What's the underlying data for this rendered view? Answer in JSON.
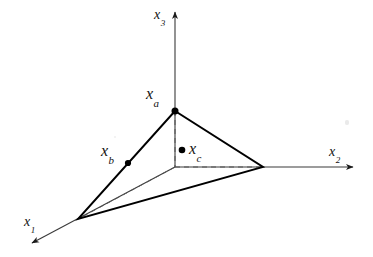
{
  "figure": {
    "type": "geometric-diagram",
    "background_color": "#ffffff",
    "line_color": "#000000",
    "width": 373,
    "height": 257
  },
  "axes": [
    {
      "id": "x1",
      "base": "x",
      "subscript": "1",
      "label": "x₁",
      "direction": "down-left",
      "origin": [
        175,
        167
      ],
      "tip": [
        27,
        246
      ],
      "label_position": [
        24,
        213
      ]
    },
    {
      "id": "x2",
      "base": "x",
      "subscript": "2",
      "label": "x₂",
      "direction": "right",
      "origin": [
        175,
        167
      ],
      "tip": [
        358,
        167
      ],
      "label_position": [
        329,
        143
      ]
    },
    {
      "id": "x3",
      "base": "x",
      "subscript": "3",
      "label": "x₃",
      "direction": "up",
      "origin": [
        175,
        167
      ],
      "tip": [
        175,
        8
      ],
      "label_position": [
        154,
        6
      ]
    }
  ],
  "origin": {
    "name": "origin",
    "position": [
      175,
      167
    ]
  },
  "simplex": {
    "name": "triangle-simplex",
    "vertices": [
      {
        "id": "apex",
        "position": [
          175,
          111
        ],
        "on_axis": "x3"
      },
      {
        "id": "left",
        "position": [
          78,
          219
        ],
        "on_axis": "x1"
      },
      {
        "id": "right",
        "position": [
          263,
          167
        ],
        "on_axis": "x2"
      }
    ],
    "edges": [
      {
        "from": "apex",
        "to": "left",
        "style": "solid"
      },
      {
        "from": "apex",
        "to": "right",
        "style": "solid"
      },
      {
        "from": "left",
        "to": "right",
        "style": "solid"
      }
    ]
  },
  "hidden_edges": [
    {
      "from": "origin",
      "to": "apex",
      "style": "dashed"
    },
    {
      "from": "origin",
      "to": "left",
      "style": "dashed"
    },
    {
      "from": "origin",
      "to": "right",
      "style": "dashed"
    }
  ],
  "points": [
    {
      "id": "xa",
      "base": "x",
      "subscript": "a",
      "label": "xₐ",
      "position": [
        175,
        111
      ],
      "label_position": [
        146,
        86
      ],
      "description": "vertex on the x3 axis"
    },
    {
      "id": "xb",
      "base": "x",
      "subscript": "b",
      "label": "x_b",
      "position": [
        128,
        163
      ],
      "label_position": [
        101,
        143
      ],
      "description": "point on the edge between apex and x1 vertex"
    },
    {
      "id": "xc",
      "base": "x",
      "subscript": "c",
      "label": "x_c",
      "position": [
        182,
        150
      ],
      "label_position": [
        189,
        141
      ],
      "description": "interior point of the simplex"
    }
  ]
}
